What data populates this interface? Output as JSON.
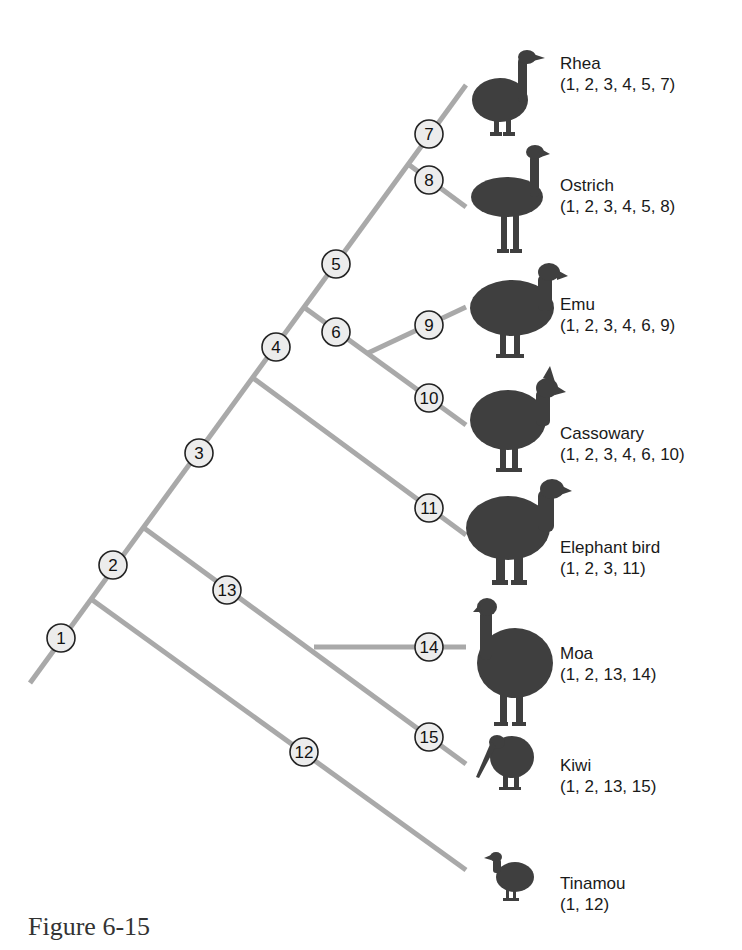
{
  "figure": {
    "caption": "Figure 6-15",
    "type": "cladogram",
    "colors": {
      "branch": "#a9a9a9",
      "node_fill": "#ececec",
      "node_stroke": "#222222",
      "silhouette": "#3f3f3f"
    }
  },
  "nodes": [
    {
      "id": 1,
      "label": "1"
    },
    {
      "id": 2,
      "label": "2"
    },
    {
      "id": 3,
      "label": "3"
    },
    {
      "id": 4,
      "label": "4"
    },
    {
      "id": 5,
      "label": "5"
    },
    {
      "id": 6,
      "label": "6"
    },
    {
      "id": 7,
      "label": "7"
    },
    {
      "id": 8,
      "label": "8"
    },
    {
      "id": 9,
      "label": "9"
    },
    {
      "id": 10,
      "label": "10"
    },
    {
      "id": 11,
      "label": "11"
    },
    {
      "id": 12,
      "label": "12"
    },
    {
      "id": 13,
      "label": "13"
    },
    {
      "id": 14,
      "label": "14"
    },
    {
      "id": 15,
      "label": "15"
    }
  ],
  "taxa": [
    {
      "name": "Rhea",
      "characters": "(1, 2, 3, 4, 5, 7)",
      "icon": "rhea-silhouette-icon"
    },
    {
      "name": "Ostrich",
      "characters": "(1, 2, 3, 4, 5, 8)",
      "icon": "ostrich-silhouette-icon"
    },
    {
      "name": "Emu",
      "characters": "(1, 2, 3, 4, 6, 9)",
      "icon": "emu-silhouette-icon"
    },
    {
      "name": "Cassowary",
      "characters": "(1, 2, 3, 4, 6, 10)",
      "icon": "cassowary-silhouette-icon"
    },
    {
      "name": "Elephant bird",
      "characters": "(1, 2, 3, 11)",
      "icon": "elephant-bird-silhouette-icon"
    },
    {
      "name": "Moa",
      "characters": "(1, 2, 13, 14)",
      "icon": "moa-silhouette-icon"
    },
    {
      "name": "Kiwi",
      "characters": "(1, 2, 13, 15)",
      "icon": "kiwi-silhouette-icon"
    },
    {
      "name": "Tinamou",
      "characters": "(1, 12)",
      "icon": "tinamou-silhouette-icon"
    }
  ]
}
